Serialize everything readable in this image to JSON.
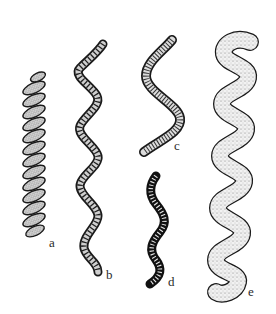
{
  "figure": {
    "background": "#ffffff",
    "ink_color": "#1a1a1a",
    "stipple_color": "#8a8a8a",
    "panels": [
      {
        "id": "a",
        "label": "a",
        "form": "tight-helix-coil",
        "label_pos": [
          49,
          242
        ]
      },
      {
        "id": "b",
        "label": "b",
        "form": "segmented-wavy-filament",
        "label_pos": [
          106,
          275
        ]
      },
      {
        "id": "c",
        "label": "c",
        "form": "segmented-s-curve-filament",
        "label_pos": [
          175,
          146
        ]
      },
      {
        "id": "d",
        "label": "d",
        "form": "small-dark-segmented-wavy-filament",
        "label_pos": [
          169,
          282
        ]
      },
      {
        "id": "e",
        "label": "e",
        "form": "large-stippled-wavy-spiral",
        "label_pos": [
          249,
          291
        ]
      }
    ]
  }
}
